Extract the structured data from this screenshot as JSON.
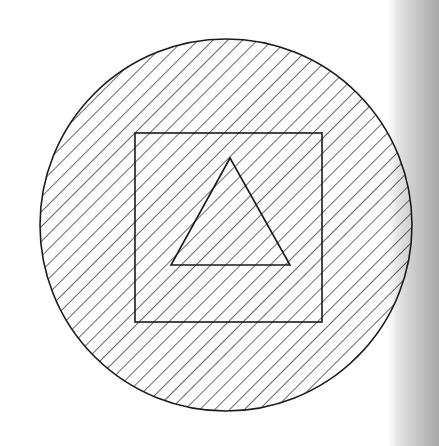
{
  "diagram": {
    "background_color": "#ffffff",
    "stroke_color": "#1a1a1a",
    "hatch": {
      "angle_deg": 45,
      "spacing_px": 10.5,
      "direction": "bottom-left to top-right"
    },
    "shapes": [
      {
        "type": "circle",
        "cx": 226,
        "cy": 225,
        "r": 186,
        "hatched": true
      },
      {
        "type": "square",
        "x": 135,
        "y": 133,
        "width": 187,
        "height": 189
      },
      {
        "type": "triangle",
        "points": [
          [
            230,
            158
          ],
          [
            171,
            265
          ],
          [
            290,
            265
          ]
        ]
      }
    ],
    "page_edge": {
      "visible": true,
      "side": "right",
      "color": "#b0b0b0"
    }
  }
}
